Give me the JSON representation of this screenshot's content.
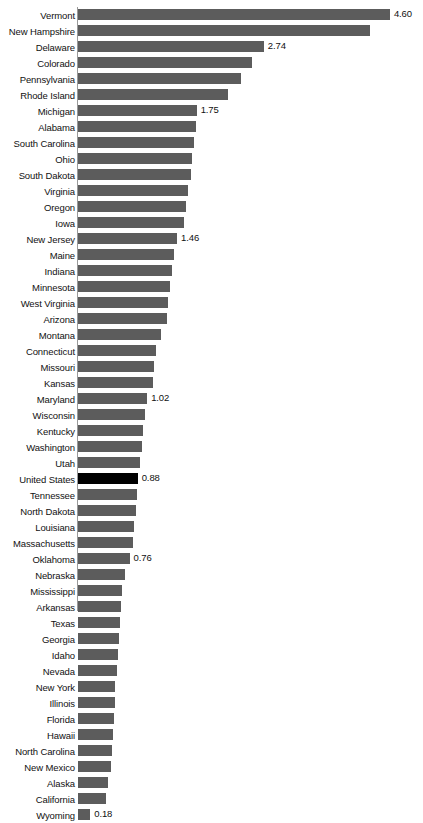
{
  "chart_data": {
    "type": "bar",
    "orientation": "horizontal",
    "title": "",
    "subtitle": "",
    "xlabel": "",
    "ylabel": "",
    "grid": false,
    "legend": null,
    "xlim": [
      0,
      4.6
    ],
    "highlight_category": "United States",
    "colors": {
      "bar": "#5c5c5c",
      "highlight_bar": "#000000",
      "axis": "#9a9a9a",
      "text": "#111111",
      "background": "#ffffff"
    },
    "categories": [
      "Vermont",
      "New Hampshire",
      "Delaware",
      "Colorado",
      "Pennsylvania",
      "Rhode Island",
      "Michigan",
      "Alabama",
      "South Carolina",
      "Ohio",
      "South Dakota",
      "Virginia",
      "Oregon",
      "Iowa",
      "New Jersey",
      "Maine",
      "Indiana",
      "Minnesota",
      "West Virginia",
      "Arizona",
      "Montana",
      "Connecticut",
      "Missouri",
      "Kansas",
      "Maryland",
      "Wisconsin",
      "Kentucky",
      "Washington",
      "Utah",
      "United States",
      "Tennessee",
      "North Dakota",
      "Louisiana",
      "Massachusetts",
      "Oklahoma",
      "Nebraska",
      "Mississippi",
      "Arkansas",
      "Texas",
      "Georgia",
      "Idaho",
      "Nevada",
      "New York",
      "Illinois",
      "Florida",
      "Hawaii",
      "North Carolina",
      "New Mexico",
      "Alaska",
      "California",
      "Wyoming"
    ],
    "values": [
      4.6,
      4.31,
      2.74,
      2.57,
      2.4,
      2.21,
      1.75,
      1.74,
      1.71,
      1.68,
      1.66,
      1.62,
      1.59,
      1.56,
      1.46,
      1.41,
      1.39,
      1.36,
      1.33,
      1.31,
      1.23,
      1.15,
      1.12,
      1.1,
      1.02,
      0.99,
      0.96,
      0.95,
      0.92,
      0.88,
      0.87,
      0.85,
      0.83,
      0.81,
      0.76,
      0.7,
      0.65,
      0.63,
      0.62,
      0.6,
      0.59,
      0.57,
      0.55,
      0.54,
      0.53,
      0.52,
      0.5,
      0.48,
      0.44,
      0.41,
      0.18
    ],
    "labeled_points": [
      {
        "category": "Vermont",
        "label": "4.60"
      },
      {
        "category": "Delaware",
        "label": "2.74"
      },
      {
        "category": "Michigan",
        "label": "1.75"
      },
      {
        "category": "New Jersey",
        "label": "1.46"
      },
      {
        "category": "Maryland",
        "label": "1.02"
      },
      {
        "category": "United States",
        "label": "0.88"
      },
      {
        "category": "Oklahoma",
        "label": "0.76"
      },
      {
        "category": "Wyoming",
        "label": "0.18"
      }
    ]
  },
  "layout": {
    "axis_x_px": 78,
    "px_per_unit": 67.8,
    "row_pitch_px": 16,
    "bar_height_px": 11,
    "top_offset_px": 7
  }
}
